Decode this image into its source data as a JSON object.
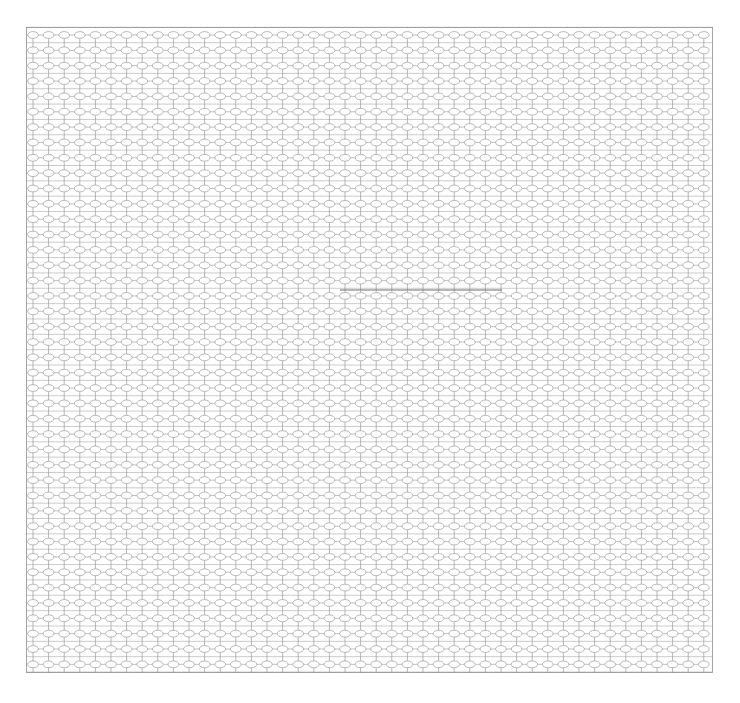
{
  "document": {
    "title": "Lattice Graph Diagram",
    "caption": "",
    "width": 740,
    "height": 703,
    "background_color": "#ffffff"
  },
  "chart_data": {
    "type": "diagram",
    "subtype": "node-link-lattice",
    "title": "",
    "grid": {
      "columns": 44,
      "rows": 42,
      "column_spacing_px": 15.6,
      "row_spacing_px": 15.35,
      "origin_x_px": 33,
      "origin_y_px": 35
    },
    "plot_area": {
      "left_px": 26,
      "top_px": 27,
      "right_px": 713,
      "bottom_px": 673,
      "width_px": 687,
      "height_px": 646
    },
    "node": {
      "shape": "ellipse",
      "rx_px": 5.4,
      "ry_px": 3.4,
      "fill": "#ffffff",
      "stroke": "#9a9a9a",
      "stroke_width_px": 0.7,
      "label": ""
    },
    "edges": {
      "vertical_stem_color": "#9a9a9a",
      "vertical_stem_width_px": 0.7,
      "horizontal_rail_color": "#a8a8a8",
      "horizontal_rail_width_px": 0.7,
      "rank_separator_color": "#b4b4b4"
    },
    "border": {
      "color": "#8f8f8f",
      "stroke_width_px": 0.8,
      "sides": [
        "left",
        "right",
        "top",
        "bottom"
      ]
    },
    "highlight": {
      "present": true,
      "kind": "darkened-horizontal-rail",
      "color": "#6f6f6f",
      "stroke_width_px": 1.1,
      "y_px": 290,
      "x_start_px": 340,
      "x_end_px": 502
    },
    "legend": {
      "present": false,
      "entries": []
    },
    "axes": {
      "present": false,
      "xlabel": "",
      "ylabel": "",
      "tick_labels": []
    },
    "annotations": []
  }
}
